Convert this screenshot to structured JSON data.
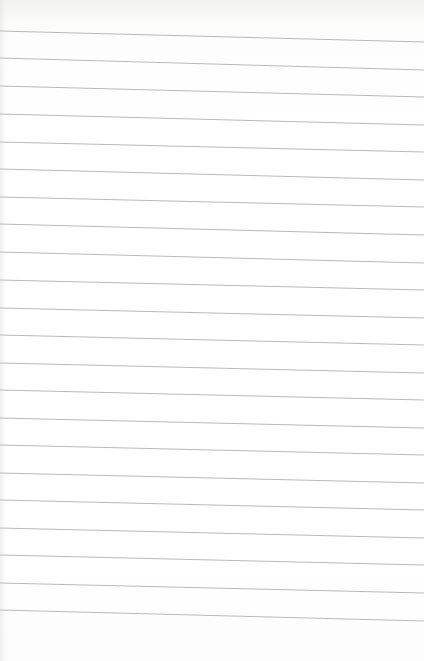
{
  "page": {
    "type": "lined-paper",
    "background_color": "#ffffff",
    "line_color": "#b9b9b9",
    "line_count": 22,
    "line_spacing_px": 27.6,
    "line_slope_px_over_width": 11,
    "lines": [
      {
        "y_left": 31,
        "y_right": 42
      },
      {
        "y_left": 58,
        "y_right": 70
      },
      {
        "y_left": 86,
        "y_right": 97
      },
      {
        "y_left": 114,
        "y_right": 125
      },
      {
        "y_left": 142,
        "y_right": 152
      },
      {
        "y_left": 169,
        "y_right": 180
      },
      {
        "y_left": 197,
        "y_right": 207
      },
      {
        "y_left": 224,
        "y_right": 235
      },
      {
        "y_left": 252,
        "y_right": 263
      },
      {
        "y_left": 280,
        "y_right": 290
      },
      {
        "y_left": 308,
        "y_right": 318
      },
      {
        "y_left": 335,
        "y_right": 345
      },
      {
        "y_left": 363,
        "y_right": 373
      },
      {
        "y_left": 390,
        "y_right": 400
      },
      {
        "y_left": 418,
        "y_right": 428
      },
      {
        "y_left": 445,
        "y_right": 455
      },
      {
        "y_left": 473,
        "y_right": 483
      },
      {
        "y_left": 500,
        "y_right": 510
      },
      {
        "y_left": 528,
        "y_right": 538
      },
      {
        "y_left": 555,
        "y_right": 565
      },
      {
        "y_left": 583,
        "y_right": 593
      },
      {
        "y_left": 610,
        "y_right": 621
      }
    ]
  }
}
